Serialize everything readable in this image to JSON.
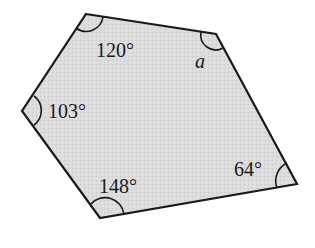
{
  "figure": {
    "shape": "pentagon",
    "fill_color": "#d9d9d9",
    "stroke_color": "#1a1a1a",
    "vertices": [
      {
        "name": "top",
        "x": 86,
        "y": 14
      },
      {
        "name": "top-right",
        "x": 216,
        "y": 34
      },
      {
        "name": "bottom-right",
        "x": 297,
        "y": 184
      },
      {
        "name": "bottom",
        "x": 100,
        "y": 218
      },
      {
        "name": "left",
        "x": 22,
        "y": 111
      }
    ],
    "angles": [
      {
        "vertex": "top",
        "label": "120°"
      },
      {
        "vertex": "top-right",
        "label": "a"
      },
      {
        "vertex": "bottom-right",
        "label": "64°"
      },
      {
        "vertex": "bottom",
        "label": "148°"
      },
      {
        "vertex": "left",
        "label": "103°"
      }
    ]
  }
}
